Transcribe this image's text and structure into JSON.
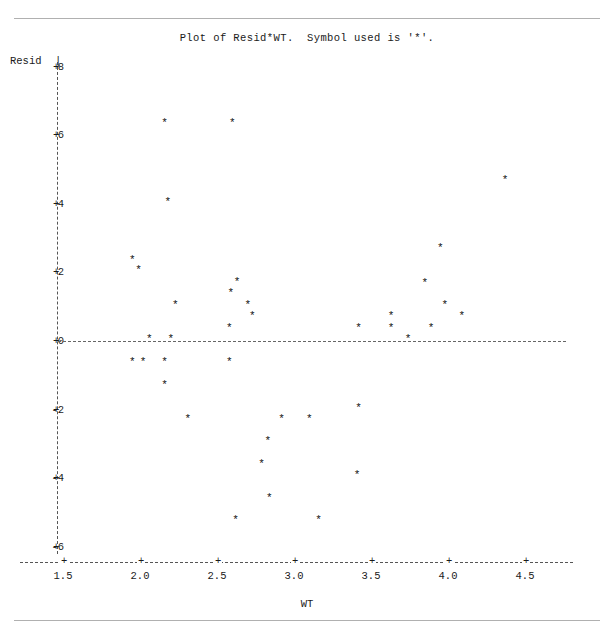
{
  "title": "Plot of Resid*WT.  Symbol used is '*'.",
  "symbol": "*",
  "axes": {
    "y_caption": "Resid",
    "y_caption_bar": "|",
    "x_caption": "WT",
    "y_ticks": [
      "8",
      "6",
      "4",
      "2",
      "0",
      "-2",
      "-4",
      "-6"
    ],
    "y_tick_mark": "+",
    "x_ticks": [
      "1.5",
      "2.0",
      "2.5",
      "3.0",
      "3.5",
      "4.0",
      "4.5"
    ],
    "x_tick_mark": "+"
  },
  "colors": {
    "rule": "#b0b0b0",
    "axis": "#555555",
    "point": "#111111",
    "text": "#1a1a1a",
    "background": "#ffffff"
  },
  "chart_data": {
    "type": "scatter",
    "title": "Plot of Resid*WT.  Symbol used is '*'.",
    "xlabel": "WT",
    "ylabel": "Resid",
    "xlim": [
      1.35,
      4.65
    ],
    "ylim": [
      -6.5,
      8.4
    ],
    "xticks": [
      1.5,
      2.0,
      2.5,
      3.0,
      3.5,
      4.0,
      4.5
    ],
    "yticks": [
      8,
      6,
      4,
      2,
      0,
      -2,
      -4,
      -6
    ],
    "grid": false,
    "legend": "none",
    "marker": "*",
    "reference_lines": [
      {
        "axis": "y",
        "value": 0,
        "style": "dashed"
      }
    ],
    "points": [
      {
        "x": 2.16,
        "y": 6.3
      },
      {
        "x": 2.6,
        "y": 6.3
      },
      {
        "x": 4.37,
        "y": 4.63
      },
      {
        "x": 2.18,
        "y": 4.0
      },
      {
        "x": 3.95,
        "y": 2.65
      },
      {
        "x": 1.95,
        "y": 2.3
      },
      {
        "x": 1.99,
        "y": 2.0
      },
      {
        "x": 3.85,
        "y": 1.63
      },
      {
        "x": 2.63,
        "y": 1.66
      },
      {
        "x": 2.59,
        "y": 1.33
      },
      {
        "x": 2.23,
        "y": 1.0
      },
      {
        "x": 2.7,
        "y": 1.0
      },
      {
        "x": 3.98,
        "y": 1.0
      },
      {
        "x": 2.73,
        "y": 0.67
      },
      {
        "x": 3.63,
        "y": 0.67
      },
      {
        "x": 4.09,
        "y": 0.67
      },
      {
        "x": 2.58,
        "y": 0.32
      },
      {
        "x": 3.42,
        "y": 0.32
      },
      {
        "x": 3.63,
        "y": 0.32
      },
      {
        "x": 3.89,
        "y": 0.32
      },
      {
        "x": 2.06,
        "y": 0.0
      },
      {
        "x": 2.2,
        "y": 0.0
      },
      {
        "x": 3.74,
        "y": 0.0
      },
      {
        "x": 1.95,
        "y": -0.67
      },
      {
        "x": 2.02,
        "y": -0.67
      },
      {
        "x": 2.16,
        "y": -0.67
      },
      {
        "x": 2.58,
        "y": -0.67
      },
      {
        "x": 2.16,
        "y": -1.34
      },
      {
        "x": 2.31,
        "y": -2.33
      },
      {
        "x": 2.92,
        "y": -2.33
      },
      {
        "x": 3.1,
        "y": -2.33
      },
      {
        "x": 3.42,
        "y": -2.0
      },
      {
        "x": 2.83,
        "y": -2.97
      },
      {
        "x": 2.79,
        "y": -3.65
      },
      {
        "x": 3.41,
        "y": -3.97
      },
      {
        "x": 2.84,
        "y": -4.64
      },
      {
        "x": 2.62,
        "y": -5.28
      },
      {
        "x": 3.16,
        "y": -5.28
      }
    ]
  }
}
